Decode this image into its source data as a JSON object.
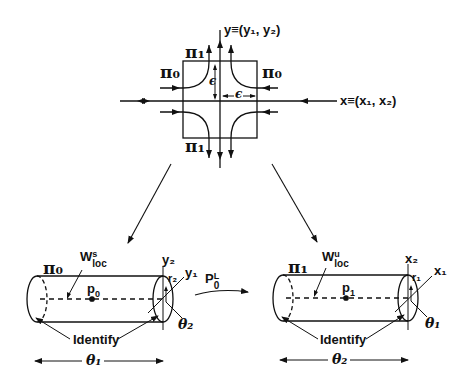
{
  "figure": {
    "top_diagram": {
      "y_axis_label": "y≡(y₁, y₂)",
      "x_axis_label": "x≡(x₁, x₂)",
      "pi1_top": "π₁",
      "pi1_bottom": "π₁",
      "pi0_left": "π₀",
      "pi0_right": "π₀",
      "epsilon_vertical": "ϵ",
      "epsilon_horizontal": "ϵ"
    },
    "left_cylinder": {
      "surface_label": "π₀",
      "manifold_main": "W",
      "manifold_sup": "s",
      "manifold_sub": "loc",
      "point_main": "p",
      "point_sub": "0",
      "coord_y2": "y₂",
      "coord_r2": "r₂",
      "coord_y1": "y₁",
      "angle_theta2": "θ₂",
      "identify_label": "Identify",
      "span_label": "θ₁"
    },
    "map": {
      "main": "P",
      "sub": "0",
      "sup": "L"
    },
    "right_cylinder": {
      "surface_label": "π₁",
      "manifold_main": "W",
      "manifold_sup": "u",
      "manifold_sub": "loc",
      "point_main": "p",
      "point_sub": "1",
      "coord_x2": "x₂",
      "coord_r1": "r₁",
      "coord_x1": "x₁",
      "angle_theta1": "θ₁",
      "identify_label": "Identify",
      "span_label": "θ₂"
    }
  }
}
